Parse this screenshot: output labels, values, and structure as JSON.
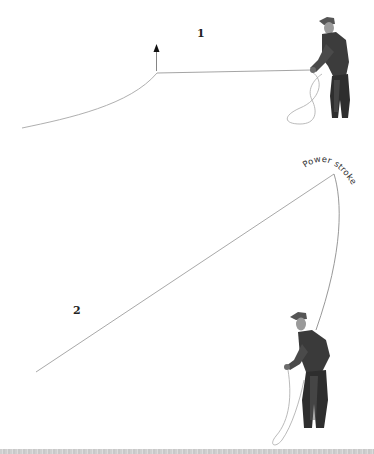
{
  "diagram": {
    "steps": [
      {
        "id": 1,
        "label": "1",
        "description": "Line lying on water; rod lifted, arrow indicates upward lift"
      },
      {
        "id": 2,
        "label": "2",
        "description": "Rod raised high, line in the air"
      }
    ],
    "annotations": {
      "power_stroke": "Power stroke"
    },
    "icons": {
      "arrow": "up-arrow-icon",
      "figure": "fly-fisherman-figure"
    },
    "colors": {
      "line": "#9a9a9a",
      "figure_dark": "#2e2e2e",
      "figure_mid": "#6b6b6b",
      "background": "#ffffff",
      "band": "#d0d0d0"
    }
  }
}
